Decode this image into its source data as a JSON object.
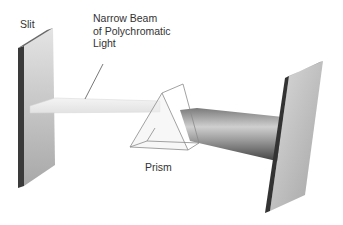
{
  "diagram": {
    "type": "prism dispersion illustration",
    "labels": {
      "slit": "Slit",
      "beam_line1": "Narrow Beam",
      "beam_line2": "of Polychromatic",
      "beam_line3": "Light",
      "prism": "Prism"
    },
    "colors": {
      "background": "#ffffff",
      "text": "#333333",
      "panel_face": "#c8c8c8",
      "panel_edge": "#3a3a3a",
      "beam": "#eeeeee",
      "prism_lines": "#888888",
      "dispersed_beam": "#9a9a9a"
    }
  }
}
